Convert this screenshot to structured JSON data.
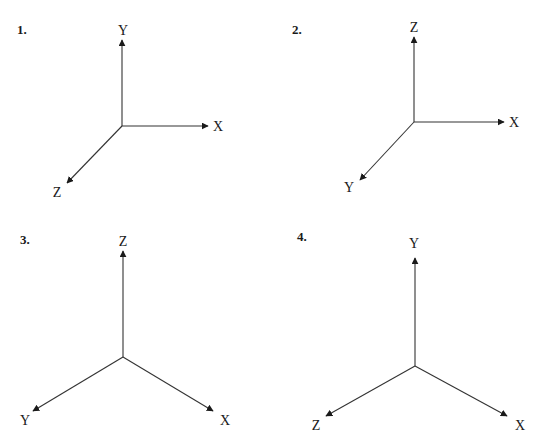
{
  "diagrams": [
    {
      "number": "1.",
      "number_pos": [
        17,
        34
      ],
      "origin": [
        122,
        126
      ],
      "axes": [
        {
          "label": "Y",
          "end": [
            122,
            40
          ],
          "label_pos": [
            123,
            35
          ]
        },
        {
          "label": "X",
          "end": [
            208,
            126
          ],
          "label_pos": [
            218,
            131
          ]
        },
        {
          "label": "Z",
          "end": [
            67,
            183
          ],
          "label_pos": [
            57,
            197
          ]
        }
      ]
    },
    {
      "number": "2.",
      "number_pos": [
        292,
        34
      ],
      "origin": [
        414,
        122
      ],
      "axes": [
        {
          "label": "Z",
          "end": [
            414,
            37
          ],
          "label_pos": [
            414,
            32
          ]
        },
        {
          "label": "X",
          "end": [
            504,
            122
          ],
          "label_pos": [
            514,
            127
          ]
        },
        {
          "label": "Y",
          "end": [
            360,
            180
          ],
          "label_pos": [
            349,
            192
          ]
        }
      ]
    },
    {
      "number": "3.",
      "number_pos": [
        20,
        244
      ],
      "origin": [
        123,
        357
      ],
      "axes": [
        {
          "label": "Z",
          "end": [
            123,
            251
          ],
          "label_pos": [
            123,
            246
          ]
        },
        {
          "label": "Y",
          "end": [
            33,
            411
          ],
          "label_pos": [
            25,
            425
          ]
        },
        {
          "label": "X",
          "end": [
            213,
            411
          ],
          "label_pos": [
            225,
            425
          ]
        }
      ]
    },
    {
      "number": "4.",
      "number_pos": [
        297,
        241
      ],
      "origin": [
        415,
        366
      ],
      "axes": [
        {
          "label": "Y",
          "end": [
            415,
            258
          ],
          "label_pos": [
            414,
            248
          ]
        },
        {
          "label": "Z",
          "end": [
            326,
            416
          ],
          "label_pos": [
            316,
            430
          ]
        },
        {
          "label": "X",
          "end": [
            507,
            416
          ],
          "label_pos": [
            520,
            430
          ]
        }
      ]
    }
  ]
}
